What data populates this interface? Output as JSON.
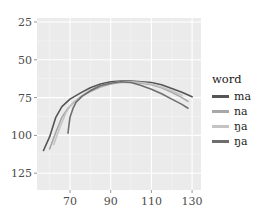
{
  "chart_data": {
    "type": "line",
    "title": "",
    "xlabel": "",
    "ylabel": "",
    "xlim": [
      52,
      132
    ],
    "ylim": [
      27,
      136
    ],
    "y_reversed": true,
    "x_ticks": [
      70,
      90,
      110,
      130
    ],
    "y_ticks": [
      25,
      50,
      75,
      100,
      125
    ],
    "grid": true,
    "legend_position": "right",
    "legend_title": "word",
    "series": [
      {
        "name": "ma",
        "color": "#555555",
        "points": [
          [
            57,
            110
          ],
          [
            60,
            101
          ],
          [
            63,
            88
          ],
          [
            66,
            81
          ],
          [
            70,
            76
          ],
          [
            75,
            72
          ],
          [
            80,
            68.5
          ],
          [
            85,
            66
          ],
          [
            90,
            64.5
          ],
          [
            95,
            64
          ],
          [
            100,
            64
          ],
          [
            105,
            64.5
          ],
          [
            110,
            65
          ],
          [
            115,
            66.5
          ],
          [
            120,
            69
          ],
          [
            125,
            71.5
          ],
          [
            130,
            74.5
          ]
        ]
      },
      {
        "name": "na",
        "color": "#a8a8a8",
        "points": [
          [
            60,
            109
          ],
          [
            63,
            98
          ],
          [
            66,
            88
          ],
          [
            69,
            82
          ],
          [
            72,
            78
          ],
          [
            76,
            74
          ],
          [
            80,
            71
          ],
          [
            85,
            68
          ],
          [
            90,
            66
          ],
          [
            95,
            65
          ],
          [
            100,
            65
          ],
          [
            105,
            65.5
          ],
          [
            110,
            66.5
          ],
          [
            115,
            68.5
          ],
          [
            120,
            71.5
          ],
          [
            125,
            75
          ],
          [
            128,
            77.5
          ]
        ]
      },
      {
        "name": "ŋa",
        "color": "#c4c4c4",
        "points": [
          [
            62,
            106
          ],
          [
            65,
            95
          ],
          [
            68,
            85
          ],
          [
            71,
            79
          ],
          [
            75,
            74.5
          ],
          [
            80,
            70
          ],
          [
            85,
            67
          ],
          [
            90,
            65.5
          ],
          [
            95,
            64.5
          ],
          [
            100,
            64.5
          ],
          [
            105,
            65
          ],
          [
            110,
            66
          ],
          [
            115,
            68
          ],
          [
            120,
            70.5
          ],
          [
            125,
            73.5
          ]
        ]
      },
      {
        "name": "ŋ̣a",
        "color": "#6e6e6e",
        "points": [
          [
            69,
            98.5
          ],
          [
            69.5,
            93
          ],
          [
            70,
            88
          ],
          [
            71.5,
            82
          ],
          [
            73,
            78
          ],
          [
            76,
            74
          ],
          [
            80,
            70.5
          ],
          [
            85,
            67
          ],
          [
            90,
            65.5
          ],
          [
            95,
            64.5
          ],
          [
            100,
            65
          ],
          [
            105,
            67
          ],
          [
            110,
            69.5
          ],
          [
            115,
            72.5
          ],
          [
            120,
            76
          ],
          [
            125,
            79.5
          ],
          [
            128,
            82
          ]
        ]
      }
    ]
  },
  "legend": {
    "title": "word",
    "items": [
      {
        "label": "ma",
        "color": "#555555"
      },
      {
        "label": "na",
        "color": "#a8a8a8"
      },
      {
        "label": "ŋa",
        "color": "#c4c4c4"
      },
      {
        "label": "ŋ̣a",
        "color": "#6e6e6e"
      }
    ]
  },
  "axes": {
    "x_tick_labels": [
      "70",
      "90",
      "110",
      "130"
    ],
    "y_tick_labels": [
      "25",
      "50",
      "75",
      "100",
      "125"
    ]
  }
}
